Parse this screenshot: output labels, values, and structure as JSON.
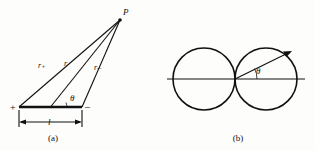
{
  "figure": {
    "panel_a": {
      "caption": "(a)",
      "point_label": "P",
      "charge_positive": "+",
      "charge_negative": "–",
      "r_plus_label": "r₊",
      "r_label": "r",
      "r_minus_label": "r–",
      "theta_label": "θ",
      "separation_label": "l",
      "geometry": {
        "point_p": [
          120,
          20
        ],
        "charge_plus": [
          19,
          107
        ],
        "charge_minus": [
          82,
          107
        ],
        "dipole_center": [
          50.5,
          107
        ],
        "dim_line_y": 122,
        "dim_left_x": 19,
        "dim_right_x": 82
      }
    },
    "panel_b": {
      "caption": "(b)",
      "theta_label": "θ",
      "geometry": {
        "circle_left_center": [
          204,
          79
        ],
        "circle_right_center": [
          266,
          79
        ],
        "circle_radius": 31,
        "axis_y": 79,
        "axis_x_start": 167,
        "axis_x_end": 305,
        "arrow_origin": [
          235,
          79
        ],
        "arrow_tip": [
          290,
          52
        ],
        "arc_radius": 22
      }
    }
  },
  "colors": {
    "ink": "#111111",
    "background": "#fdfdfc"
  }
}
